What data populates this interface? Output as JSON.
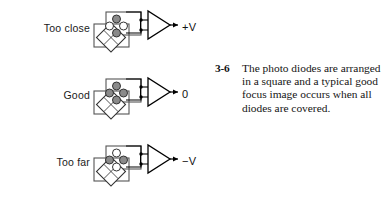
{
  "figure": {
    "background_color": "#ffffff",
    "line_color": "#000000",
    "diode_fill_color": "#8a8a8a",
    "rows": [
      {
        "label": "Too close",
        "output": "+V",
        "shading": "vertical-pair",
        "name": "too-close"
      },
      {
        "label": "Good",
        "output": "0",
        "shading": "all-covered",
        "name": "good"
      },
      {
        "label": "Too far",
        "output": "−V",
        "shading": "horizontal-pair",
        "name": "too-far"
      }
    ]
  },
  "caption": {
    "number": "3-6",
    "text": "The photo diodes are arranged in a square and a typical good focus image occurs when all diodes are covered."
  }
}
